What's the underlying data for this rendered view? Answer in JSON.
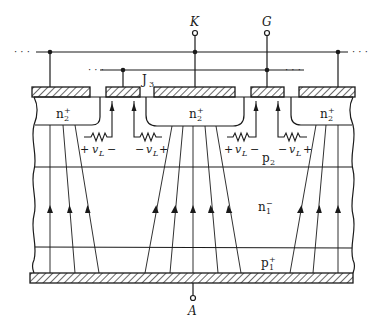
{
  "diagram": {
    "type": "semiconductor-cross-section",
    "terminals": {
      "cathode": "K",
      "gate": "G",
      "anode": "A"
    },
    "junction_label": {
      "main": "J",
      "sub": "3"
    },
    "regions": {
      "n2_plus": {
        "main": "n",
        "sup": "+",
        "sub": "2"
      },
      "p2": {
        "main": "p",
        "sub": "2"
      },
      "n1_minus": {
        "main": "n",
        "sup": "−",
        "sub": "1"
      },
      "p1_plus": {
        "main": "p",
        "sup": "+",
        "sub": "1"
      }
    },
    "lateral_voltages": [
      {
        "plus": "+",
        "v": "v",
        "sub": "L",
        "minus": "−",
        "order": "plus-left"
      },
      {
        "plus": "+",
        "v": "v",
        "sub": "L",
        "minus": "−",
        "order": "minus-left"
      },
      {
        "plus": "+",
        "v": "v",
        "sub": "L",
        "minus": "−",
        "order": "plus-left"
      },
      {
        "plus": "+",
        "v": "v",
        "sub": "L",
        "minus": "−",
        "order": "minus-left"
      }
    ],
    "continuation": "· · ·",
    "colors": {
      "ink": "#1a1a1a",
      "background": "#ffffff"
    }
  }
}
